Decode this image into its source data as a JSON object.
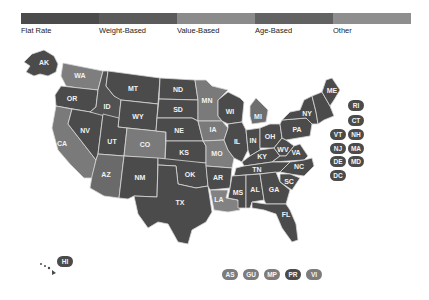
{
  "legend": {
    "items": [
      {
        "label": "Flat Rate",
        "color": "#4b4b4b"
      },
      {
        "label": "Weight-Based",
        "color": "#5b5b5b"
      },
      {
        "label": "Value-Based",
        "color": "#8b8b8b"
      },
      {
        "label": "Age-Based",
        "color": "#626262"
      },
      {
        "label": "Other",
        "color": "#8e8e8e"
      }
    ]
  },
  "map": {
    "states": {
      "AK": {
        "label": "AK",
        "color": "#4b4b4b"
      },
      "WA": {
        "label": "WA",
        "color": "#7e7e7e"
      },
      "OR": {
        "label": "OR",
        "color": "#4b4b4b"
      },
      "CA": {
        "label": "CA",
        "color": "#7a7a7a"
      },
      "NV": {
        "label": "NV",
        "color": "#4b4b4b"
      },
      "ID": {
        "label": "ID",
        "color": "#525252"
      },
      "MT": {
        "label": "MT",
        "color": "#4b4b4b"
      },
      "WY": {
        "label": "WY",
        "color": "#4b4b4b"
      },
      "UT": {
        "label": "UT",
        "color": "#4b4b4b"
      },
      "CO": {
        "label": "CO",
        "color": "#7a7a7a"
      },
      "AZ": {
        "label": "AZ",
        "color": "#6a6a6a"
      },
      "NM": {
        "label": "NM",
        "color": "#4b4b4b"
      },
      "ND": {
        "label": "ND",
        "color": "#4b4b4b"
      },
      "SD": {
        "label": "SD",
        "color": "#4b4b4b"
      },
      "NE": {
        "label": "NE",
        "color": "#4b4b4b"
      },
      "KS": {
        "label": "KS",
        "color": "#4b4b4b"
      },
      "OK": {
        "label": "OK",
        "color": "#4b4b4b"
      },
      "TX": {
        "label": "TX",
        "color": "#4b4b4b"
      },
      "MN": {
        "label": "MN",
        "color": "#7a7a7a"
      },
      "IA": {
        "label": "IA",
        "color": "#7a7a7a"
      },
      "MO": {
        "label": "MO",
        "color": "#7e7e7e"
      },
      "AR": {
        "label": "AR",
        "color": "#4b4b4b"
      },
      "LA": {
        "label": "LA",
        "color": "#828282"
      },
      "WI": {
        "label": "WI",
        "color": "#4b4b4b"
      },
      "IL": {
        "label": "IL",
        "color": "#4b4b4b"
      },
      "MI": {
        "label": "MI",
        "color": "#6e6e6e"
      },
      "IN": {
        "label": "IN",
        "color": "#4b4b4b"
      },
      "OH": {
        "label": "OH",
        "color": "#4b4b4b"
      },
      "KY": {
        "label": "KY",
        "color": "#4b4b4b"
      },
      "TN": {
        "label": "TN",
        "color": "#4b4b4b"
      },
      "MS": {
        "label": "MS",
        "color": "#4b4b4b"
      },
      "AL": {
        "label": "AL",
        "color": "#4b4b4b"
      },
      "GA": {
        "label": "GA",
        "color": "#4b4b4b"
      },
      "FL": {
        "label": "FL",
        "color": "#4b4b4b"
      },
      "SC": {
        "label": "SC",
        "color": "#4b4b4b"
      },
      "NC": {
        "label": "NC",
        "color": "#4b4b4b"
      },
      "VA": {
        "label": "VA",
        "color": "#4b4b4b"
      },
      "WV": {
        "label": "WV",
        "color": "#4b4b4b"
      },
      "PA": {
        "label": "PA",
        "color": "#4b4b4b"
      },
      "NY": {
        "label": "NY",
        "color": "#4b4b4b"
      },
      "ME": {
        "label": "ME",
        "color": "#4b4b4b"
      }
    },
    "small_state_badges": [
      {
        "label": "RI",
        "color": "#4b4b4b"
      },
      {
        "label": "CT",
        "color": "#4b4b4b"
      },
      {
        "label": "VT",
        "color": "#4b4b4b"
      },
      {
        "label": "NH",
        "color": "#4b4b4b"
      },
      {
        "label": "NJ",
        "color": "#4b4b4b"
      },
      {
        "label": "MA",
        "color": "#4b4b4b"
      },
      {
        "label": "DE",
        "color": "#4b4b4b"
      },
      {
        "label": "MD",
        "color": "#4b4b4b"
      },
      {
        "label": "DC",
        "color": "#4b4b4b"
      }
    ],
    "hawaii_badge": {
      "label": "HI",
      "color": "#4b4b4b"
    },
    "territory_badges": [
      {
        "label": "AS",
        "color": "#7c7c7c"
      },
      {
        "label": "GU",
        "color": "#7c7c7c"
      },
      {
        "label": "MP",
        "color": "#7c7c7c"
      },
      {
        "label": "PR",
        "color": "#4b4b4b"
      },
      {
        "label": "VI",
        "color": "#7c7c7c"
      }
    ]
  }
}
